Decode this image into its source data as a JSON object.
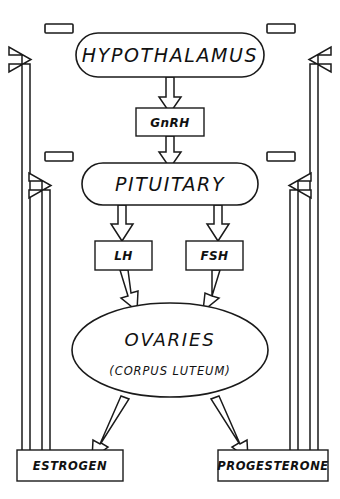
{
  "diagram": {
    "type": "flowchart",
    "colors": {
      "stroke": "#1a1a1a",
      "fill": "#ffffff",
      "background": "#ffffff"
    },
    "nodes": {
      "hypothalamus": {
        "label": "HYPOTHALAMUS",
        "shape": "stadium"
      },
      "gnrh": {
        "label": "GnRH",
        "shape": "rectangle"
      },
      "pituitary": {
        "label": "PITUITARY",
        "shape": "stadium"
      },
      "lh": {
        "label": "LH",
        "shape": "rectangle"
      },
      "fsh": {
        "label": "FSH",
        "shape": "rectangle"
      },
      "ovaries": {
        "label": "OVARIES",
        "sublabel": "(CORPUS LUTEUM)",
        "shape": "ellipse"
      },
      "estrogen": {
        "label": "ESTROGEN",
        "shape": "rectangle"
      },
      "progesterone": {
        "label": "PROGESTERONE",
        "shape": "rectangle"
      }
    },
    "feedback_markers": {
      "top_left": {
        "label": "",
        "shape": "small-rectangle"
      },
      "top_right": {
        "label": "",
        "shape": "small-rectangle"
      },
      "mid_left": {
        "label": "",
        "shape": "small-rectangle"
      },
      "mid_right": {
        "label": "",
        "shape": "small-rectangle"
      }
    },
    "edges": [
      {
        "from": "hypothalamus",
        "to": "gnrh",
        "style": "hollow-arrow-down"
      },
      {
        "from": "gnrh",
        "to": "pituitary",
        "style": "hollow-arrow-down"
      },
      {
        "from": "pituitary",
        "to": "lh",
        "style": "hollow-arrow-down"
      },
      {
        "from": "pituitary",
        "to": "fsh",
        "style": "hollow-arrow-down"
      },
      {
        "from": "lh",
        "to": "ovaries",
        "style": "hollow-arrow-down"
      },
      {
        "from": "fsh",
        "to": "ovaries",
        "style": "hollow-arrow-down"
      },
      {
        "from": "ovaries",
        "to": "estrogen",
        "style": "hollow-arrow-diagonal"
      },
      {
        "from": "ovaries",
        "to": "progesterone",
        "style": "hollow-arrow-diagonal"
      },
      {
        "from": "estrogen",
        "to": "hypothalamus",
        "style": "hollow-feedback-left-outer"
      },
      {
        "from": "estrogen",
        "to": "pituitary",
        "style": "hollow-feedback-left-inner"
      },
      {
        "from": "progesterone",
        "to": "hypothalamus",
        "style": "hollow-feedback-right-outer"
      },
      {
        "from": "progesterone",
        "to": "pituitary",
        "style": "hollow-feedback-right-inner"
      }
    ]
  }
}
